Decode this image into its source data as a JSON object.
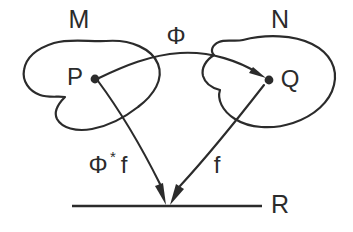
{
  "diagram": {
    "background_color": "#ffffff",
    "stroke_color": "#2b2b2b",
    "sets": [
      {
        "id": "M",
        "label": "M",
        "description": "source-manifold-blob"
      },
      {
        "id": "N",
        "label": "N",
        "description": "target-manifold-blob"
      },
      {
        "id": "R",
        "label": "R",
        "description": "real-line"
      }
    ],
    "points": [
      {
        "id": "P",
        "label": "P",
        "in_set": "M"
      },
      {
        "id": "Q",
        "label": "Q",
        "in_set": "N"
      }
    ],
    "maps": [
      {
        "id": "phi",
        "label": "Φ",
        "from": "P",
        "to": "Q",
        "style": "curved-arrow"
      },
      {
        "id": "f",
        "label": "f",
        "from": "Q",
        "to": "R",
        "style": "straight-arrow"
      },
      {
        "id": "pullback",
        "label_base": "Φ",
        "label_sup": "*",
        "label_tail": "f",
        "label_full": "Φ*f",
        "from": "P",
        "to": "R",
        "style": "straight-arrow"
      }
    ]
  },
  "labels": {
    "set_m": "M",
    "set_n": "N",
    "set_r": "R",
    "point_p": "P",
    "point_q": "Q",
    "map_phi": "Φ",
    "map_f": "f",
    "pullback_phi": "Φ",
    "pullback_star": "*",
    "pullback_f": "f"
  }
}
